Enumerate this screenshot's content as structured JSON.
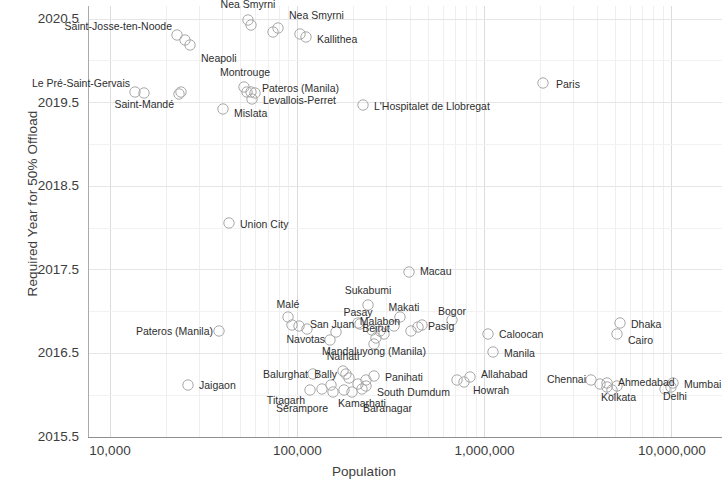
{
  "chart_data": {
    "type": "scatter",
    "title": "",
    "xlabel": "Population",
    "ylabel": "Required  Year for 50% Offload",
    "xscale": "log",
    "xlim": [
      8000,
      20000000
    ],
    "ylim": [
      2015.5,
      2020.8
    ],
    "grid": true,
    "legend": null,
    "xticks": [
      "10,000",
      "100,000",
      "1,000,000",
      "10,000,000"
    ],
    "xtick_values": [
      10000,
      100000,
      1000000,
      10000000
    ],
    "yticks": [
      "2015.5",
      "2016.5",
      "2017.5",
      "2018.5",
      "2019.5",
      "2020.5"
    ],
    "ytick_values": [
      2015.5,
      2016.5,
      2017.5,
      2018.5,
      2019.5,
      2020.5
    ],
    "points": [
      {
        "label": "Nea Smyrni",
        "x": 52000,
        "y": 2020.62,
        "px": 248,
        "py": 20,
        "lx": 248,
        "ly": 10,
        "anchor": "above"
      },
      {
        "label": "Nea Smyrni",
        "x": 92000,
        "y": 2020.45,
        "px": 278,
        "py": 28,
        "lx": 289,
        "ly": 15,
        "anchor": "right"
      },
      {
        "label": "Saint-Josse-ten-Noode",
        "x": 28000,
        "y": 2020.33,
        "px": 177,
        "py": 35,
        "lx": 172,
        "ly": 26,
        "anchor": "left"
      },
      {
        "label": "Kallithea",
        "x": 126000,
        "y": 2020.3,
        "px": 306,
        "py": 37,
        "lx": 317,
        "ly": 39,
        "anchor": "right"
      },
      {
        "label": "Neapoli",
        "x": 33000,
        "y": 2020.13,
        "px": 190,
        "py": 45,
        "lx": 201,
        "ly": 58,
        "anchor": "right"
      },
      {
        "label": "Paris",
        "x": 2240000,
        "y": 2019.62,
        "px": 543,
        "py": 83,
        "lx": 556,
        "ly": 84,
        "anchor": "right"
      },
      {
        "label": "Montrouge",
        "x": 49000,
        "y": 2019.58,
        "px": 244,
        "py": 87,
        "lx": 245,
        "ly": 78,
        "anchor": "above-left"
      },
      {
        "label": "Le Pré-Saint-Gervais",
        "x": 17800,
        "y": 2019.5,
        "px": 135,
        "py": 92,
        "lx": 130,
        "ly": 83,
        "anchor": "left"
      },
      {
        "label": "Pateros (Manila)",
        "x": 64000,
        "y": 2019.5,
        "px": 251,
        "py": 92,
        "lx": 262,
        "ly": 88,
        "anchor": "right"
      },
      {
        "label": "Saint-Mandé",
        "x": 29000,
        "y": 2019.47,
        "px": 179,
        "py": 94,
        "lx": 174,
        "ly": 104,
        "anchor": "left"
      },
      {
        "label": "Levallois-Perret",
        "x": 65000,
        "y": 2019.43,
        "px": 252,
        "py": 99,
        "lx": 263,
        "ly": 100,
        "anchor": "right"
      },
      {
        "label": "L'Hospitalet de Llobregat",
        "x": 260000,
        "y": 2019.4,
        "px": 363,
        "py": 105,
        "lx": 374,
        "ly": 106,
        "anchor": "right"
      },
      {
        "label": "Mislata",
        "x": 43000,
        "y": 2019.35,
        "px": 223,
        "py": 109,
        "lx": 234,
        "ly": 113,
        "anchor": "right"
      },
      {
        "label": "Union City",
        "x": 49000,
        "y": 2017.92,
        "px": 229,
        "py": 223,
        "lx": 240,
        "ly": 224,
        "anchor": "right"
      },
      {
        "label": "Macau",
        "x": 590000,
        "y": 2017.55,
        "px": 409,
        "py": 272,
        "lx": 420,
        "ly": 271,
        "anchor": "right"
      },
      {
        "label": "Sukabumi",
        "x": 300000,
        "y": 2016.95,
        "px": 368,
        "py": 305,
        "lx": 368,
        "ly": 296,
        "anchor": "above"
      },
      {
        "label": "Malé",
        "x": 104000,
        "y": 2016.85,
        "px": 288,
        "py": 317,
        "lx": 288,
        "ly": 310,
        "anchor": "above"
      },
      {
        "label": "Makati",
        "x": 540000,
        "y": 2016.85,
        "px": 400,
        "py": 317,
        "lx": 404,
        "ly": 313,
        "anchor": "above-right"
      },
      {
        "label": "Bogor",
        "x": 900000,
        "y": 2016.82,
        "px": 452,
        "py": 320,
        "lx": 452,
        "ly": 317,
        "anchor": "above"
      },
      {
        "label": "Pasay",
        "x": 270000,
        "y": 2016.8,
        "px": 358,
        "py": 323,
        "lx": 358,
        "ly": 318,
        "anchor": "above"
      },
      {
        "label": "Dhaka",
        "x": 5000000,
        "y": 2016.78,
        "px": 620,
        "py": 323,
        "lx": 631,
        "ly": 324,
        "anchor": "right"
      },
      {
        "label": "San Juan",
        "x": 122000,
        "y": 2016.78,
        "px": 299,
        "py": 326,
        "lx": 310,
        "ly": 324,
        "anchor": "right"
      },
      {
        "label": "Pasig",
        "x": 620000,
        "y": 2016.78,
        "px": 422,
        "py": 325,
        "lx": 428,
        "ly": 326,
        "anchor": "right"
      },
      {
        "label": "Pateros (Manila)",
        "x": 39000,
        "y": 2016.72,
        "px": 219,
        "py": 331,
        "lx": 213,
        "ly": 331,
        "anchor": "left"
      },
      {
        "label": "Malabon",
        "x": 360000,
        "y": 2016.73,
        "px": 380,
        "py": 331,
        "lx": 380,
        "ly": 327,
        "anchor": "above"
      },
      {
        "label": "Caloocan",
        "x": 1050000,
        "y": 2016.7,
        "px": 488,
        "py": 334,
        "lx": 499,
        "ly": 334,
        "anchor": "right"
      },
      {
        "label": "Cairo",
        "x": 4900000,
        "y": 2016.7,
        "px": 617,
        "py": 334,
        "lx": 628,
        "ly": 340,
        "anchor": "right"
      },
      {
        "label": "Beirut",
        "x": 330000,
        "y": 2016.66,
        "px": 376,
        "py": 338,
        "lx": 376,
        "ly": 334,
        "anchor": "above"
      },
      {
        "label": "Navotas",
        "x": 175000,
        "y": 2016.64,
        "px": 330,
        "py": 340,
        "lx": 325,
        "ly": 339,
        "anchor": "left"
      },
      {
        "label": "Mandaluyong (Manila)",
        "x": 330000,
        "y": 2016.58,
        "px": 374,
        "py": 344,
        "lx": 374,
        "ly": 346,
        "anchor": "below"
      },
      {
        "label": "Manila",
        "x": 1100000,
        "y": 2016.55,
        "px": 493,
        "py": 352,
        "lx": 504,
        "ly": 353,
        "anchor": "right"
      },
      {
        "label": "Naihati",
        "x": 220000,
        "y": 2016.38,
        "px": 343,
        "py": 371,
        "lx": 343,
        "ly": 362,
        "anchor": "above"
      },
      {
        "label": "Balurghat",
        "x": 150000,
        "y": 2016.34,
        "px": 313,
        "py": 374,
        "lx": 308,
        "ly": 374,
        "anchor": "left"
      },
      {
        "label": "Bally",
        "x": 228000,
        "y": 2016.33,
        "px": 346,
        "py": 374,
        "lx": 337,
        "ly": 374,
        "anchor": "left"
      },
      {
        "label": "Panihati",
        "x": 330000,
        "y": 2016.33,
        "px": 374,
        "py": 376,
        "lx": 385,
        "ly": 377,
        "anchor": "right"
      },
      {
        "label": "Allahabad",
        "x": 990000,
        "y": 2016.33,
        "px": 470,
        "py": 377,
        "lx": 481,
        "ly": 374,
        "anchor": "right"
      },
      {
        "label": "Chennai",
        "x": 3100000,
        "y": 2016.3,
        "px": 591,
        "py": 380,
        "lx": 586,
        "ly": 379,
        "anchor": "left"
      },
      {
        "label": "Ahmedabad",
        "x": 4300000,
        "y": 2016.28,
        "px": 607,
        "py": 383,
        "lx": 618,
        "ly": 382,
        "anchor": "right"
      },
      {
        "label": "Mumbai",
        "x": 8900000,
        "y": 2016.26,
        "px": 673,
        "py": 383,
        "lx": 684,
        "ly": 384,
        "anchor": "right"
      },
      {
        "label": "Jaigaon",
        "x": 21000,
        "y": 2016.24,
        "px": 188,
        "py": 385,
        "lx": 199,
        "ly": 385,
        "anchor": "right"
      },
      {
        "label": "Howrah",
        "x": 1020000,
        "y": 2016.25,
        "px": 464,
        "py": 382,
        "lx": 473,
        "ly": 390,
        "anchor": "right"
      },
      {
        "label": "South Dumdum",
        "x": 320000,
        "y": 2016.22,
        "px": 366,
        "py": 386,
        "lx": 377,
        "ly": 392,
        "anchor": "right"
      },
      {
        "label": "Titagarh",
        "x": 135000,
        "y": 2016.15,
        "px": 310,
        "py": 390,
        "lx": 305,
        "ly": 400,
        "anchor": "left"
      },
      {
        "label": "Serampore",
        "x": 190000,
        "y": 2016.12,
        "px": 333,
        "py": 392,
        "lx": 328,
        "ly": 408,
        "anchor": "left"
      },
      {
        "label": "Baranagar",
        "x": 250000,
        "y": 2016.12,
        "px": 352,
        "py": 392,
        "lx": 363,
        "ly": 408,
        "anchor": "right"
      },
      {
        "label": "Kamarhati",
        "x": 290000,
        "y": 2016.17,
        "px": 362,
        "py": 389,
        "lx": 362,
        "ly": 398,
        "anchor": "below"
      },
      {
        "label": "Kolkata",
        "x": 4600000,
        "y": 2016.18,
        "px": 612,
        "py": 390,
        "lx": 601,
        "ly": 397,
        "anchor": "right"
      },
      {
        "label": "Delhi",
        "x": 8700000,
        "y": 2016.2,
        "px": 665,
        "py": 389,
        "lx": 663,
        "ly": 396,
        "anchor": "right"
      }
    ],
    "extra_markers": [
      {
        "px": 255,
        "py": 93
      },
      {
        "px": 247,
        "py": 92
      },
      {
        "px": 181,
        "py": 92
      },
      {
        "px": 144,
        "py": 93
      },
      {
        "px": 185,
        "py": 40
      },
      {
        "px": 251,
        "py": 25
      },
      {
        "px": 273,
        "py": 32
      },
      {
        "px": 300,
        "py": 34
      },
      {
        "px": 360,
        "py": 324
      },
      {
        "px": 372,
        "py": 330
      },
      {
        "px": 384,
        "py": 334
      },
      {
        "px": 394,
        "py": 326
      },
      {
        "px": 411,
        "py": 331
      },
      {
        "px": 418,
        "py": 327
      },
      {
        "px": 336,
        "py": 332
      },
      {
        "px": 307,
        "py": 329
      },
      {
        "px": 292,
        "py": 325
      },
      {
        "px": 349,
        "py": 378
      },
      {
        "px": 358,
        "py": 384
      },
      {
        "px": 331,
        "py": 385
      },
      {
        "px": 322,
        "py": 389
      },
      {
        "px": 344,
        "py": 390
      },
      {
        "px": 366,
        "py": 380
      },
      {
        "px": 607,
        "py": 387
      },
      {
        "px": 617,
        "py": 386
      },
      {
        "px": 600,
        "py": 384
      },
      {
        "px": 671,
        "py": 387
      },
      {
        "px": 457,
        "py": 380
      }
    ]
  }
}
